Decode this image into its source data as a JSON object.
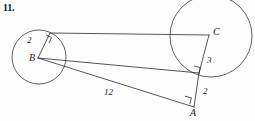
{
  "problem": {
    "number": "11."
  },
  "figure": {
    "type": "geometry-diagram",
    "stroke_color": "#2b2b2b",
    "background_color": "#fdfdfd",
    "points": [
      {
        "name": "B",
        "label": "B",
        "x": 38,
        "y": 58
      },
      {
        "name": "C",
        "label": "C",
        "x": 209,
        "y": 35
      },
      {
        "name": "A",
        "label": "A",
        "x": 194,
        "y": 107
      }
    ],
    "circles": [
      {
        "name": "circle-B",
        "center": "B",
        "cx": 39,
        "cy": 57,
        "r": 27,
        "radius_label": "2"
      },
      {
        "name": "circle-C",
        "center": "C",
        "cx": 211,
        "cy": 36,
        "r": 41,
        "radius_label": "3"
      }
    ],
    "labels": {
      "vertex_b": "B",
      "vertex_c": "C",
      "vertex_a": "A",
      "radius_b": "2",
      "radius_c": "3",
      "segment_a": "2",
      "segment_ba": "12"
    },
    "right_angles": [
      {
        "name": "right-angle-tangent-b",
        "x": 46,
        "y": 37
      },
      {
        "name": "right-angle-tangent-c",
        "x": 198,
        "y": 69
      },
      {
        "name": "right-angle-at-a",
        "x": 190,
        "y": 98
      }
    ],
    "segments": [
      {
        "name": "tangent-b-to-c",
        "from": "tangent-point-B",
        "to": "C"
      },
      {
        "name": "tangent-c-to-b",
        "from": "B",
        "to": "tangent-point-C"
      },
      {
        "name": "segment-b-a",
        "from": "B",
        "to": "A",
        "label": "12"
      },
      {
        "name": "radius-b",
        "from": "B",
        "to": "tangent-point-B",
        "label": "2"
      },
      {
        "name": "radius-c",
        "from": "C",
        "to": "tangent-point-C",
        "label": "3"
      },
      {
        "name": "segment-a-tangent-c",
        "from": "A",
        "to": "tangent-point-C",
        "label": "2"
      }
    ]
  }
}
